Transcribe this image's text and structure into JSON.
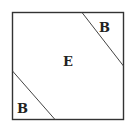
{
  "diagram": {
    "regions": [
      {
        "id": "top-right",
        "label": "B"
      },
      {
        "id": "center",
        "label": "E"
      },
      {
        "id": "bottom-left",
        "label": "B"
      }
    ],
    "colors": {
      "stroke": "#333333",
      "background": "#ffffff",
      "text": "#222222"
    }
  }
}
